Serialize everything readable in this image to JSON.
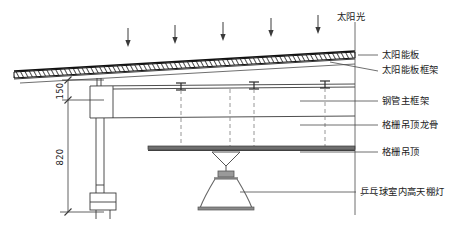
{
  "diagram": {
    "title_label": "太阳光",
    "colors": {
      "line": "#3a3a3a",
      "dark": "#111111",
      "text": "#1a1a1a",
      "hatch": "#222222",
      "dash": "#7a7a7a"
    },
    "sun_arrows_count": 5,
    "annotations": [
      {
        "key": "solar_panel",
        "label": "太阳能板",
        "x": 382,
        "y": 54
      },
      {
        "key": "solar_panel_frame",
        "label": "太阳能板框架",
        "x": 382,
        "y": 70
      },
      {
        "key": "steel_main_frame",
        "label": "钢管主框架",
        "x": 382,
        "y": 100
      },
      {
        "key": "grille_keel",
        "label": "格栅吊顶龙骨",
        "x": 382,
        "y": 124
      },
      {
        "key": "grille_ceiling",
        "label": "格栅吊顶",
        "x": 382,
        "y": 151
      },
      {
        "key": "high_bay_lamp",
        "label": "乒乓球室内高天棚灯",
        "x": 360,
        "y": 191
      }
    ],
    "dimensions": [
      {
        "key": "dim-150",
        "value": "150",
        "x": 58,
        "y": 90
      },
      {
        "key": "dim-820",
        "value": "820",
        "x": 58,
        "y": 156
      }
    ]
  }
}
